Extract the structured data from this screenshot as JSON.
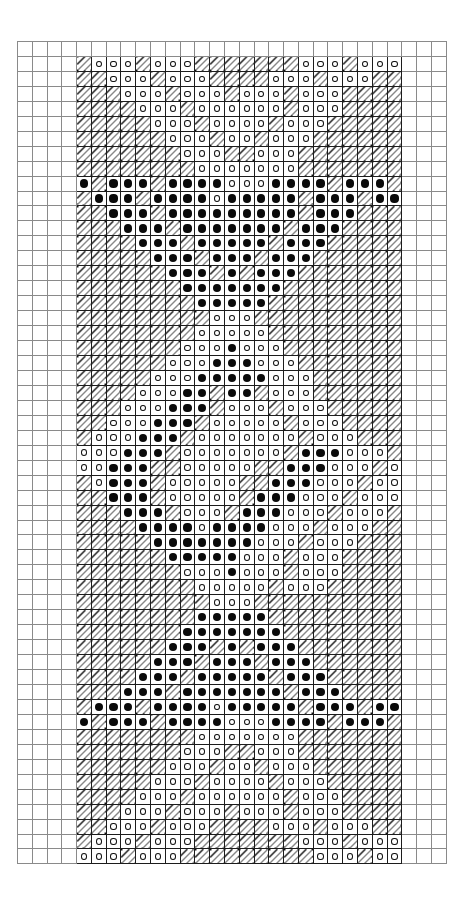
{
  "chart_data": {
    "type": "heatmap",
    "title": "Knitting / cross-stitch symbol chart",
    "grid": {
      "columns": 29,
      "rows": 55,
      "cell_width_px": 14.79,
      "cell_height_px": 14.96,
      "origin_x_px": 17,
      "origin_y_px": 41
    },
    "pattern_block": {
      "col_start": 4,
      "col_end": 24,
      "row_start": 1,
      "row_end": 54,
      "width": 21,
      "height": 54
    },
    "legend": [
      {
        "key": ".",
        "symbol": "empty",
        "label": "plain background square"
      },
      {
        "key": "/",
        "symbol": "diagonal-hatch",
        "label": "hatched stitch"
      },
      {
        "key": "o",
        "symbol": "open-circle",
        "label": "open circle stitch"
      },
      {
        "key": "#",
        "symbol": "filled-dot",
        "label": "filled dot stitch"
      }
    ],
    "xlabel": "stitch column",
    "ylabel": "row",
    "grid_on": true,
    "legend_position": "none",
    "rows": [
      "/ooo/ooo///////ooo/ooo",
      "//ooo/ooo////ooo/ooo//",
      "///ooo/ooo/ooo/ooo////",
      "////ooo/oooooo/ooo////",
      "/////ooo/oooo/ooo/////",
      "//////ooo/oo/ooo//////",
      "///////ooo//ooo///////",
      "////////ooooooo///////",
      "#/###/####ooo####/###/",
      "/###/####o#####/###/##",
      "//###/#########/###///",
      "///###/#######/###////",
      "////###/#####/###/////",
      "/////###/###/###//////",
      "//////###/#/###///////",
      "///////#######////////",
      "////////#####/////////",
      "/////////ooo//////////",
      "////////ooooo/////////",
      "///////ooo#ooo////////",
      "//////ooo###ooo///////",
      "/////ooo#####ooo//////",
      "////ooo##/##/ooo//////",
      "///ooo###/ooo/ooo/////",
      "//ooo###/ooooo/ooo////",
      "/ooo###/ooooooo/ooo///",
      "ooo###/ooooooo/###ooo/",
      "oo###//ooooo//###ooo/o",
      "/o###/ooooo//###ooo/oo",
      "//###/ooooo/###ooo/ooo",
      "///###/ooo/###ooo/ooo/",
      "////####o####ooo/ooo//",
      "/////#######ooo/ooo///",
      "//////#####ooo/ooo////",
      "///////ooo#ooo/ooo////",
      "////////ooooo/ooo/////",
      "/////////ooo//////////",
      "////////#####/////////",
      "///////#######////////",
      "//////###/#/###///////",
      "/////###/###/###//////",
      "////###/#####/###/////",
      "///###/#######/###////",
      "/###/####o#####/###/##",
      "#/###/####ooo####/###/",
      "////////ooooooo///////",
      "///////ooo//ooo///////",
      "//////ooo/oo/ooo//////",
      "/////ooo/oooo/ooo/////",
      "////ooo/oooooo/ooo////",
      "///ooo/ooo/ooo/ooo////",
      "//ooo/ooo////ooo/ooo//",
      "/ooo/ooo///////ooo/ooo",
      "ooo/ooo/////////ooo/oo"
    ]
  }
}
